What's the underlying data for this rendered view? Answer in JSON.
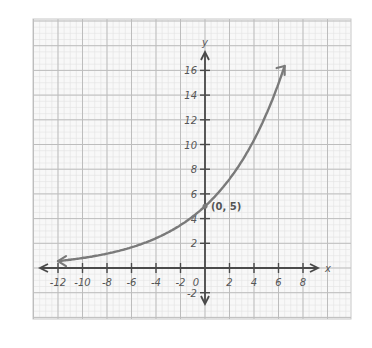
{
  "chart_data": {
    "type": "line",
    "title": "",
    "function": "y = 5(1.2)^x",
    "xlabel": "x",
    "ylabel": "y",
    "xlim": [
      -14,
      12
    ],
    "ylim": [
      -4,
      20
    ],
    "x_ticks": [
      -12,
      -10,
      -8,
      -6,
      -4,
      -2,
      2,
      4,
      6,
      8
    ],
    "x_tick_labels": [
      "-12",
      "-10",
      "-8",
      "-6",
      "-4",
      "-2",
      "2",
      "4",
      "6",
      "8"
    ],
    "y_ticks": [
      -2,
      2,
      4,
      6,
      8,
      10,
      12,
      14,
      16
    ],
    "y_tick_labels": [
      "-2",
      "2",
      "4",
      "6",
      "8",
      "10",
      "12",
      "14",
      "16"
    ],
    "origin_label": "0",
    "grid": true,
    "series": [
      {
        "name": "exponential curve",
        "x": [
          -12,
          -10,
          -8,
          -6,
          -4,
          -2,
          0,
          2,
          4,
          6,
          6.5
        ],
        "y": [
          0.56,
          0.81,
          1.16,
          1.67,
          2.41,
          3.47,
          5.0,
          7.2,
          10.37,
          14.93,
          16.36
        ]
      }
    ],
    "annotations": [
      {
        "text": "(0, 5)",
        "x": 0,
        "y": 5
      }
    ]
  },
  "colors": {
    "curve": "#7a7a7a",
    "axis": "#4a4a4a",
    "grid_major": "#bdbdbd",
    "grid_minor": "#e2e2e2",
    "text": "#555555"
  }
}
